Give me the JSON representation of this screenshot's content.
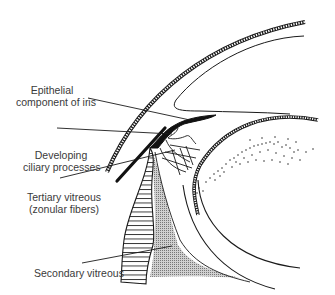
{
  "figure": {
    "colors": {
      "ink": "#1a1a1a",
      "stipple_fill": "#b8b8b8",
      "label_text": "#3a3a3a",
      "background": "#ffffff"
    }
  },
  "labels": [
    {
      "id": "epithelial-iris",
      "lines": [
        "Epithelial",
        "component of iris"
      ]
    },
    {
      "id": "ciliary-processes",
      "lines": [
        "Developing",
        "ciliary processes"
      ]
    },
    {
      "id": "tertiary-vitreous",
      "lines": [
        "Tertiary vitreous",
        "(zonular fibers)"
      ]
    },
    {
      "id": "secondary-vitreous",
      "lines": [
        "Secondary vitreous"
      ]
    }
  ]
}
